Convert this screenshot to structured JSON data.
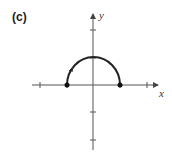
{
  "figure": {
    "panel_label": "(c)",
    "x_axis_label": "x",
    "y_axis_label": "y"
  },
  "graph": {
    "type": "semicircle",
    "description": "Upper half of circle centered at origin, traced counterclockwise... direction arrow on left side",
    "radius": 1,
    "endpoints": [
      [
        -1,
        0
      ],
      [
        1,
        0
      ]
    ],
    "x_ticks": [
      -2,
      -1,
      1,
      2
    ],
    "y_ticks": [
      -2,
      -1,
      1,
      2
    ],
    "colors": {
      "stroke": "#222222",
      "axis": "#555555"
    }
  }
}
